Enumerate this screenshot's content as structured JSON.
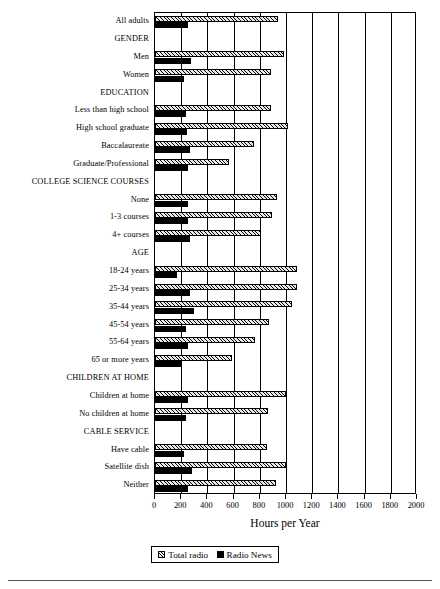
{
  "chart_data": {
    "type": "bar",
    "orientation": "horizontal",
    "title": "",
    "xlabel": "Hours per Year",
    "ylabel": "",
    "xlim": [
      0,
      2000
    ],
    "xticks": [
      0,
      200,
      400,
      600,
      800,
      1000,
      1200,
      1400,
      1600,
      1800,
      2000
    ],
    "grid": true,
    "grid_axis": "x",
    "legend_position": "bottom",
    "legend": [
      "Total radio",
      "Radio News"
    ],
    "series": [
      {
        "name": "Total radio",
        "style": "hatched",
        "values": [
          939,
          null,
          985,
          885,
          null,
          885,
          1015,
          755,
          565,
          null,
          935,
          895,
          810,
          null,
          1084,
          1085,
          1045,
          870,
          760,
          590,
          null,
          1000,
          865,
          null,
          855,
          1000,
          925
        ]
      },
      {
        "name": "Radio News",
        "style": "solid-black",
        "values": [
          250,
          null,
          275,
          220,
          null,
          240,
          245,
          270,
          250,
          null,
          250,
          250,
          265,
          null,
          170,
          270,
          295,
          235,
          255,
          205,
          null,
          250,
          240,
          null,
          225,
          285,
          255
        ]
      }
    ],
    "categories": [
      {
        "label": "All adults",
        "type": "item"
      },
      {
        "label": "GENDER",
        "type": "group"
      },
      {
        "label": "Men",
        "type": "item"
      },
      {
        "label": "Women",
        "type": "item"
      },
      {
        "label": "EDUCATION",
        "type": "group"
      },
      {
        "label": "Less than high school",
        "type": "item"
      },
      {
        "label": "High school graduate",
        "type": "item"
      },
      {
        "label": "Baccalaureate",
        "type": "item"
      },
      {
        "label": "Graduate/Professional",
        "type": "item"
      },
      {
        "label": "COLLEGE SCIENCE COURSES",
        "type": "group"
      },
      {
        "label": "None",
        "type": "item"
      },
      {
        "label": "1-3 courses",
        "type": "item"
      },
      {
        "label": "4+ courses",
        "type": "item"
      },
      {
        "label": "AGE",
        "type": "group"
      },
      {
        "label": "18-24 years",
        "type": "item"
      },
      {
        "label": "25-34 years",
        "type": "item"
      },
      {
        "label": "35-44 years",
        "type": "item"
      },
      {
        "label": "45-54 years",
        "type": "item"
      },
      {
        "label": "55-64 years",
        "type": "item"
      },
      {
        "label": "65 or more years",
        "type": "item"
      },
      {
        "label": "CHILDREN AT HOME",
        "type": "group"
      },
      {
        "label": "Children at home",
        "type": "item"
      },
      {
        "label": "No children at home",
        "type": "item"
      },
      {
        "label": "CABLE SERVICE",
        "type": "group"
      },
      {
        "label": "Have cable",
        "type": "item"
      },
      {
        "label": "Satellite dish",
        "type": "item"
      },
      {
        "label": "Neither",
        "type": "item"
      }
    ]
  },
  "colors": {
    "axis": "#000000",
    "total_radio_fill": "#e8e8e8",
    "radio_news_fill": "#000000",
    "background": "#ffffff"
  }
}
